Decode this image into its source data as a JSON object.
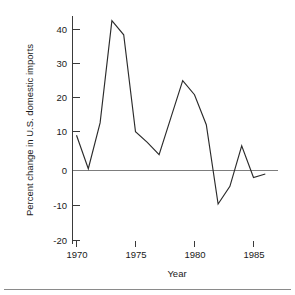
{
  "chart_data": {
    "type": "line",
    "title": "",
    "xlabel": "Year",
    "ylabel": "Percent change in U.S. domestic imports",
    "xlim": [
      1969.6,
      1986.6
    ],
    "ylim": [
      -22,
      45
    ],
    "grid": false,
    "legend": null,
    "zero_reference_line": 0,
    "x_ticks": [
      1970,
      1975,
      1980,
      1985
    ],
    "x_tick_labels": [
      "1970",
      "1975",
      "1980",
      "1985"
    ],
    "y_ticks": [
      -20,
      -10,
      0,
      10,
      20,
      30,
      40
    ],
    "y_tick_labels": [
      "-20",
      "-10",
      "0",
      "10",
      "20",
      "30",
      "40"
    ],
    "x": [
      1970,
      1971,
      1972,
      1973,
      1974,
      1975,
      1976,
      1977,
      1978,
      1979,
      1980,
      1981,
      1982,
      1983,
      1984,
      1985,
      1986
    ],
    "values": [
      10,
      0.5,
      13.5,
      42.5,
      38.5,
      11,
      8,
      4.5,
      15,
      25.5,
      21.5,
      13,
      -9.5,
      -4.5,
      7,
      -2,
      -1
    ],
    "series": [
      {
        "name": "Percent change in U.S. domestic imports",
        "values": [
          10,
          0.5,
          13.5,
          42.5,
          38.5,
          11,
          8,
          4.5,
          15,
          25.5,
          21.5,
          13,
          -9.5,
          -4.5,
          7,
          -2,
          -1
        ]
      }
    ],
    "colors": {
      "line": "#2b2b2b",
      "axis": "#3a3a3a",
      "zero_line": "#7d7d7d",
      "background": "#ffffff",
      "text": "#1a1a1a"
    }
  },
  "footer": {
    "rule_visible": true
  }
}
